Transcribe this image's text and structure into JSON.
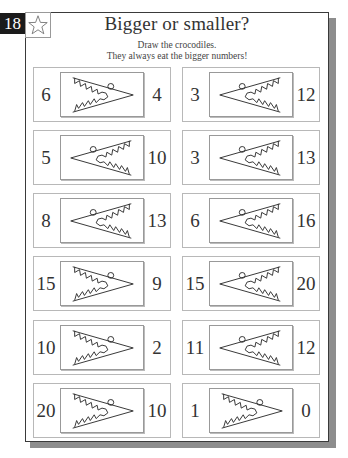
{
  "page_number": "18",
  "title": "Bigger or smaller?",
  "instructions": [
    "Draw the crocodiles.",
    "They always eat the bigger numbers!"
  ],
  "icons": {
    "star": "star-outline-icon",
    "crocodile": "crocodile-mouth-icon"
  },
  "colors": {
    "badge_bg": "#1b1b1b",
    "border": "#3a3a3a",
    "shadow": "#8d8d8d",
    "text": "#333333"
  },
  "exercises": {
    "left": [
      {
        "left": "6",
        "right": "4",
        "mouth_opens_toward": "left"
      },
      {
        "left": "5",
        "right": "10",
        "mouth_opens_toward": "right"
      },
      {
        "left": "8",
        "right": "13",
        "mouth_opens_toward": "right"
      },
      {
        "left": "15",
        "right": "9",
        "mouth_opens_toward": "left"
      },
      {
        "left": "10",
        "right": "2",
        "mouth_opens_toward": "left"
      },
      {
        "left": "20",
        "right": "10",
        "mouth_opens_toward": "left"
      }
    ],
    "right": [
      {
        "left": "3",
        "right": "12",
        "mouth_opens_toward": "right"
      },
      {
        "left": "3",
        "right": "13",
        "mouth_opens_toward": "right"
      },
      {
        "left": "6",
        "right": "16",
        "mouth_opens_toward": "right"
      },
      {
        "left": "15",
        "right": "20",
        "mouth_opens_toward": "right"
      },
      {
        "left": "11",
        "right": "12",
        "mouth_opens_toward": "right"
      },
      {
        "left": "1",
        "right": "0",
        "mouth_opens_toward": "left"
      }
    ]
  }
}
